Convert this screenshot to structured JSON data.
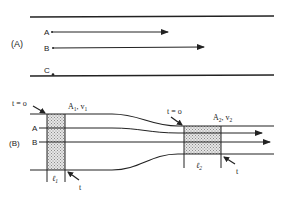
{
  "figure": {
    "panel_a": {
      "label": "(A)",
      "streamlines": [
        {
          "label": "A",
          "has_arrow": true
        },
        {
          "label": "B",
          "has_arrow": true
        },
        {
          "label": "C",
          "has_arrow": false
        }
      ]
    },
    "panel_b": {
      "label": "(B)",
      "streamline_labels": [
        "A",
        "B"
      ],
      "left_section": {
        "time_start": "t = o",
        "area_velocity": "A₁, v₁",
        "area": "A",
        "area_sub": "1",
        "velocity": "v",
        "velocity_sub": "1",
        "length": "ℓ",
        "length_sub": "1",
        "time_end": "t"
      },
      "right_section": {
        "time_start": "t = o",
        "area": "A",
        "area_sub": "2",
        "velocity": "v",
        "velocity_sub": "2",
        "length": "ℓ",
        "length_sub": "2",
        "time_end": "t"
      }
    },
    "colors": {
      "line": "#222222",
      "shade": "#bdbdbd"
    }
  }
}
